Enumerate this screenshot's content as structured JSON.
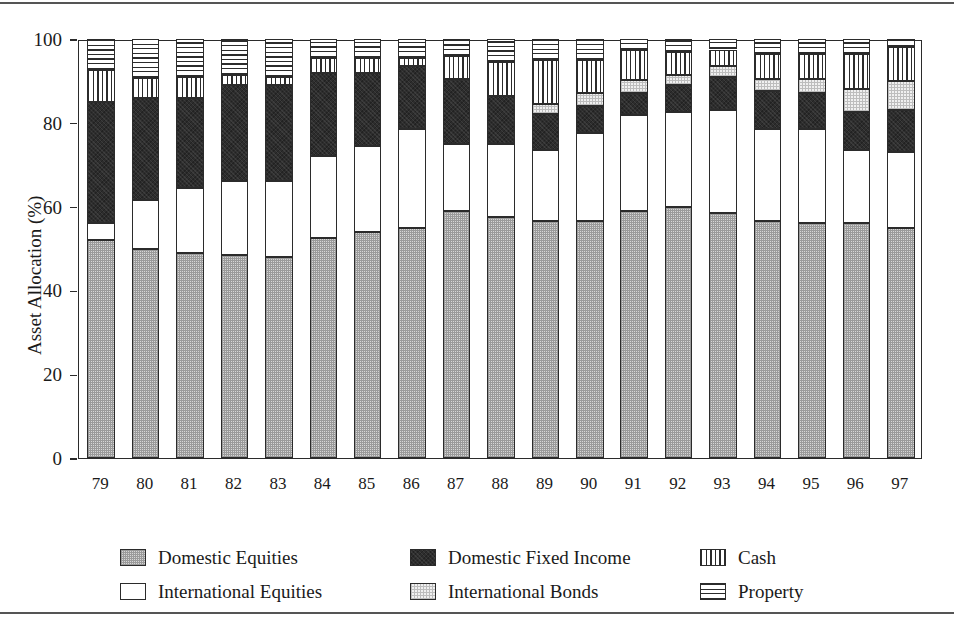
{
  "figure": {
    "background": "#ffffff",
    "axis_color": "#2b2b2b",
    "rules": {
      "top": true,
      "bottom": true
    }
  },
  "chart_data": {
    "type": "bar",
    "subtype": "stacked-bar-100-percent",
    "title": "",
    "xlabel": "",
    "ylabel": "Asset Allocation (%)",
    "ylim": [
      0,
      100
    ],
    "yticks": [
      0,
      20,
      40,
      60,
      80,
      100
    ],
    "ytick_labels": [
      "0",
      "20",
      "40",
      "60",
      "80",
      "100"
    ],
    "grid": false,
    "legend_position": "below-axes",
    "categories": [
      "79",
      "80",
      "81",
      "82",
      "83",
      "84",
      "85",
      "86",
      "87",
      "88",
      "89",
      "90",
      "91",
      "92",
      "93",
      "94",
      "95",
      "96",
      "97"
    ],
    "series": [
      {
        "name": "Domestic Equities",
        "key": "domestic-equities",
        "color": "#d6d6d6",
        "pattern": "fine-checker-grey",
        "values": [
          52.0,
          50.0,
          49.0,
          48.5,
          48.0,
          52.5,
          54.0,
          55.0,
          59.0,
          57.5,
          56.5,
          56.5,
          59.0,
          60.0,
          58.5,
          56.5,
          56.0,
          56.0,
          55.0
        ]
      },
      {
        "name": "International Equities",
        "key": "international-equities",
        "color": "#ffffff",
        "pattern": "solid-white",
        "values": [
          4.0,
          11.5,
          15.5,
          17.5,
          18.0,
          19.5,
          20.5,
          23.5,
          16.0,
          17.5,
          17.0,
          21.0,
          22.8,
          22.5,
          24.5,
          22.0,
          22.5,
          17.5,
          18.0
        ]
      },
      {
        "name": "Domestic Fixed Income",
        "key": "domestic-fixed-income",
        "color": "#2d2d2d",
        "pattern": "solid-dark",
        "values": [
          29.0,
          24.5,
          21.5,
          23.0,
          23.0,
          20.0,
          17.5,
          15.0,
          15.5,
          11.5,
          8.5,
          6.5,
          5.4,
          6.5,
          8.0,
          9.0,
          8.5,
          9.0,
          10.0
        ]
      },
      {
        "name": "International Bonds",
        "key": "international-bonds",
        "color": "#f0f0f0",
        "pattern": "light-speckle",
        "values": [
          0.0,
          0.0,
          0.0,
          0.0,
          0.0,
          0.0,
          0.0,
          0.0,
          0.0,
          0.0,
          2.5,
          3.0,
          3.0,
          2.5,
          2.5,
          3.0,
          3.5,
          5.5,
          7.0
        ]
      },
      {
        "name": "Cash",
        "key": "cash",
        "color": "#ffffff",
        "pattern": "vertical-lines",
        "values": [
          7.6,
          4.8,
          5.0,
          2.5,
          2.0,
          3.5,
          3.4,
          2.0,
          5.5,
          8.0,
          10.5,
          8.0,
          7.2,
          5.5,
          4.0,
          6.0,
          6.0,
          8.5,
          8.0
        ]
      },
      {
        "name": "Property",
        "key": "property",
        "color": "#ffffff",
        "pattern": "horizontal-lines",
        "values": [
          7.4,
          9.2,
          9.0,
          8.5,
          9.0,
          4.5,
          4.6,
          4.5,
          4.0,
          5.5,
          5.0,
          5.0,
          2.6,
          3.0,
          2.5,
          3.5,
          3.5,
          3.5,
          2.0
        ]
      }
    ]
  },
  "legend": {
    "rows": [
      [
        {
          "label": "Domestic Equities",
          "key": "domestic-equities"
        },
        {
          "label": "Domestic Fixed Income",
          "key": "domestic-fixed-income"
        },
        {
          "label": "Cash",
          "key": "cash"
        }
      ],
      [
        {
          "label": "International Equities",
          "key": "international-equities"
        },
        {
          "label": "International Bonds",
          "key": "international-bonds"
        },
        {
          "label": "Property",
          "key": "property"
        }
      ]
    ]
  }
}
